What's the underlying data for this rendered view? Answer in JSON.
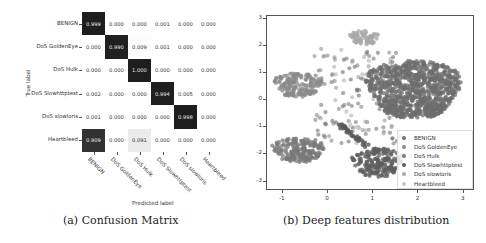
{
  "figure": {
    "subfigure_a": {
      "caption": "(a) Confusion Matrix",
      "xlabel": "Predicted label",
      "ylabel": "True label",
      "labels": [
        "BENIGN",
        "DoS GoldenEye",
        "DoS Hulk",
        "DoS Slowhttptest",
        "DoS slowloris",
        "Heartbleed"
      ],
      "matrix": [
        [
          "0.999",
          "0.000",
          "0.000",
          "0.001",
          "0.000",
          "0.000"
        ],
        [
          "0.000",
          "0.990",
          "0.009",
          "0.001",
          "0.000",
          "0.000"
        ],
        [
          "0.000",
          "0.000",
          "1.000",
          "0.000",
          "0.000",
          "0.000"
        ],
        [
          "0.002",
          "0.000",
          "0.000",
          "0.994",
          "0.005",
          "0.000"
        ],
        [
          "0.001",
          "0.000",
          "0.000",
          "0.000",
          "0.998",
          "0.000"
        ],
        [
          "0.909",
          "0.000",
          "0.091",
          "0.000",
          "0.000",
          "0.000"
        ]
      ]
    },
    "subfigure_b": {
      "caption": "(b) Deep features distribution",
      "x_ticks": [
        "-1",
        "0",
        "1",
        "2",
        "3"
      ],
      "y_ticks": [
        "3",
        "2",
        "1",
        "0",
        "-1",
        "-2",
        "-3"
      ],
      "legend": [
        "BENIGN",
        "DoS GoldenEye",
        "DoS Hulk",
        "DoS Slowhttptest",
        "DoS slowloris",
        "Heartbleed"
      ],
      "legend_colors": [
        "#6e6e6e",
        "#8a8a8a",
        "#7a7a7a",
        "#5e5e5e",
        "#a8a8a8",
        "#c8c8c8"
      ]
    }
  },
  "chart_data": [
    {
      "type": "heatmap",
      "title": "Confusion Matrix",
      "xlabel": "Predicted label",
      "ylabel": "True label",
      "x_categories": [
        "BENIGN",
        "DoS GoldenEye",
        "DoS Hulk",
        "DoS Slowhttptest",
        "DoS slowloris",
        "Heartbleed"
      ],
      "y_categories": [
        "BENIGN",
        "DoS GoldenEye",
        "DoS Hulk",
        "DoS Slowhttptest",
        "DoS slowloris",
        "Heartbleed"
      ],
      "values": [
        [
          0.999,
          0.0,
          0.0,
          0.001,
          0.0,
          0.0
        ],
        [
          0.0,
          0.99,
          0.009,
          0.001,
          0.0,
          0.0
        ],
        [
          0.0,
          0.0,
          1.0,
          0.0,
          0.0,
          0.0
        ],
        [
          0.002,
          0.0,
          0.0,
          0.994,
          0.005,
          0.0
        ],
        [
          0.001,
          0.0,
          0.0,
          0.0,
          0.998,
          0.0
        ],
        [
          0.909,
          0.0,
          0.091,
          0.0,
          0.0,
          0.0
        ]
      ],
      "colormap": "greys"
    },
    {
      "type": "scatter",
      "title": "Deep features distribution",
      "xlabel": "",
      "ylabel": "",
      "xlim": [
        -1.35,
        3.25
      ],
      "ylim": [
        -3.35,
        3.1
      ],
      "x_ticks": [
        -1,
        0,
        1,
        2,
        3
      ],
      "y_ticks": [
        -3,
        -2,
        -1,
        0,
        1,
        2,
        3
      ],
      "legend_position": "lower right",
      "series": [
        {
          "name": "BENIGN",
          "clusters": [
            {
              "cx": 1.9,
              "cy": 0.4,
              "rx": 1.0,
              "ry": 1.2
            }
          ]
        },
        {
          "name": "DoS GoldenEye",
          "clusters": [
            {
              "cx": -0.65,
              "cy": 0.55,
              "rx": 0.5,
              "ry": 0.5
            }
          ]
        },
        {
          "name": "DoS Hulk",
          "clusters": [
            {
              "cx": -0.65,
              "cy": -1.85,
              "rx": 0.55,
              "ry": 0.5
            }
          ]
        },
        {
          "name": "DoS Slowhttptest",
          "clusters": [
            {
              "cx": 1.1,
              "cy": -2.3,
              "rx": 0.55,
              "ry": 0.6
            }
          ]
        },
        {
          "name": "DoS slowloris",
          "clusters": [
            {
              "cx": 0.8,
              "cy": 2.3,
              "rx": 0.3,
              "ry": 0.3
            }
          ]
        },
        {
          "name": "Heartbleed",
          "clusters": [
            {
              "cx": 0.5,
              "cy": -1.0,
              "rx": 0.2,
              "ry": 0.2
            }
          ]
        }
      ]
    }
  ]
}
